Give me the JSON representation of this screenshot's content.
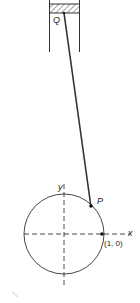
{
  "diagram": {
    "labels": {
      "piston_point": "Q",
      "crank_point": "P",
      "y_axis": "y",
      "x_axis": "x",
      "point_coord": "(1, 0)"
    },
    "colors": {
      "stroke": "#333333",
      "background": "#ffffff"
    }
  }
}
